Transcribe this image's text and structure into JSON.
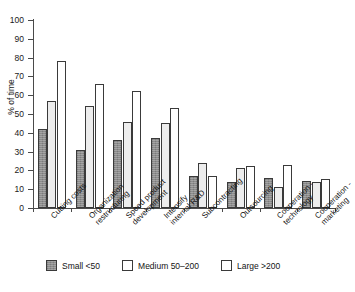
{
  "chart_data": {
    "type": "bar",
    "title": "",
    "xlabel": "",
    "ylabel": "% of time",
    "ylim": [
      0,
      100
    ],
    "ytick_step": 10,
    "yticks": [
      0,
      10,
      20,
      30,
      40,
      50,
      60,
      70,
      80,
      90,
      100
    ],
    "grid": false,
    "legend_position": "bottom",
    "categories": [
      "Cutting costs",
      "Organization restructuring",
      "Speed product development",
      "Intensify internal R&D",
      "Subcontracting",
      "Outsourcing",
      "Cooperation - technology",
      "Cooperation - marketing"
    ],
    "category_lines": [
      [
        "Cutting costs"
      ],
      [
        "Organization",
        "restructuring"
      ],
      [
        "Speed product",
        "development"
      ],
      [
        "Intensify",
        "internal R&D"
      ],
      [
        "Subcontracting"
      ],
      [
        "Outsourcing"
      ],
      [
        "Cooperation -",
        "technology"
      ],
      [
        "Cooperation -",
        "marketing"
      ]
    ],
    "series": [
      {
        "name": "Small <50",
        "key": "small",
        "color": "#8c8c8c",
        "values": [
          42,
          31,
          36,
          37,
          17,
          14,
          16,
          14.5
        ]
      },
      {
        "name": "Medium 50-200",
        "key": "medium",
        "color": "#ededed",
        "values": [
          57,
          54,
          46,
          45,
          24,
          21.5,
          11,
          14
        ]
      },
      {
        "name": "Large >200",
        "key": "large",
        "color": "#ffffff",
        "values": [
          78,
          66,
          62,
          53,
          17,
          22.5,
          23,
          15.5
        ]
      }
    ]
  },
  "axis": {
    "y_label": "% of time",
    "y_tick_labels": [
      "100",
      "90",
      "80",
      "70",
      "60",
      "50",
      "40",
      "30",
      "20",
      "10",
      "0"
    ]
  },
  "legend": {
    "items": [
      {
        "label": "Small <50",
        "key": "small"
      },
      {
        "label": "Medium 50–200",
        "key": "medium"
      },
      {
        "label": "Large >200",
        "key": "large"
      }
    ]
  },
  "caption": {
    "partial_text": ""
  }
}
